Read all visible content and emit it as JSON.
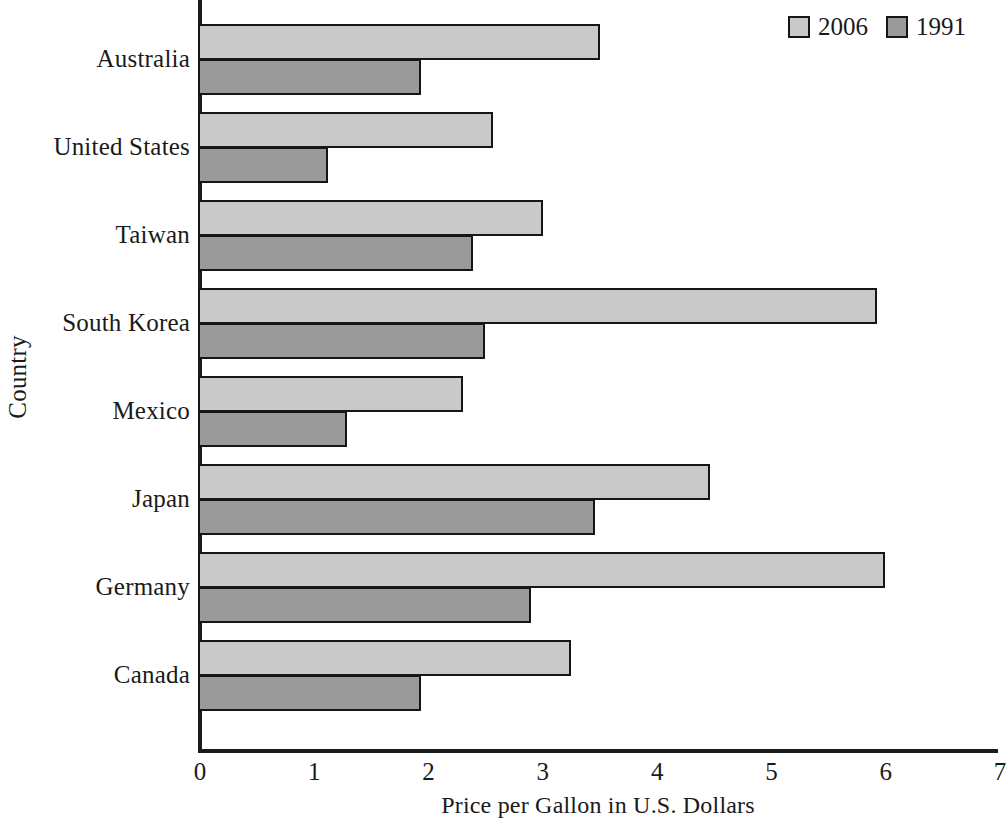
{
  "chart_data": {
    "type": "bar",
    "orientation": "horizontal",
    "title": "",
    "xlabel": "Price per Gallon in U.S. Dollars",
    "ylabel": "Country",
    "xlim": [
      0,
      7
    ],
    "xticks": [
      0,
      1,
      2,
      3,
      4,
      5,
      6,
      7
    ],
    "xtick_labels": [
      "0",
      "1",
      "2",
      "3",
      "4",
      "5",
      "6",
      "7"
    ],
    "grid": false,
    "legend_position": "top-right",
    "categories": [
      "Australia",
      "United States",
      "Taiwan",
      "South Korea",
      "Mexico",
      "Japan",
      "Germany",
      "Canada"
    ],
    "series": [
      {
        "name": "2006",
        "color": "#c9c9c9",
        "values": [
          3.5,
          2.56,
          3.0,
          5.92,
          2.3,
          4.46,
          5.99,
          3.25
        ]
      },
      {
        "name": "1991",
        "color": "#9a9a9a",
        "values": [
          1.93,
          1.12,
          2.39,
          2.49,
          1.29,
          3.46,
          2.9,
          1.93
        ]
      }
    ],
    "legend": [
      {
        "label": "2006",
        "color": "#c9c9c9"
      },
      {
        "label": "1991",
        "color": "#9a9a9a"
      }
    ],
    "colors": {
      "series_2006": "#c9c9c9",
      "series_1991": "#9a9a9a",
      "axis": "#1c1c1c",
      "bar_outline": "#161616",
      "background": "#ffffff",
      "text": "#1a1a1a"
    }
  }
}
